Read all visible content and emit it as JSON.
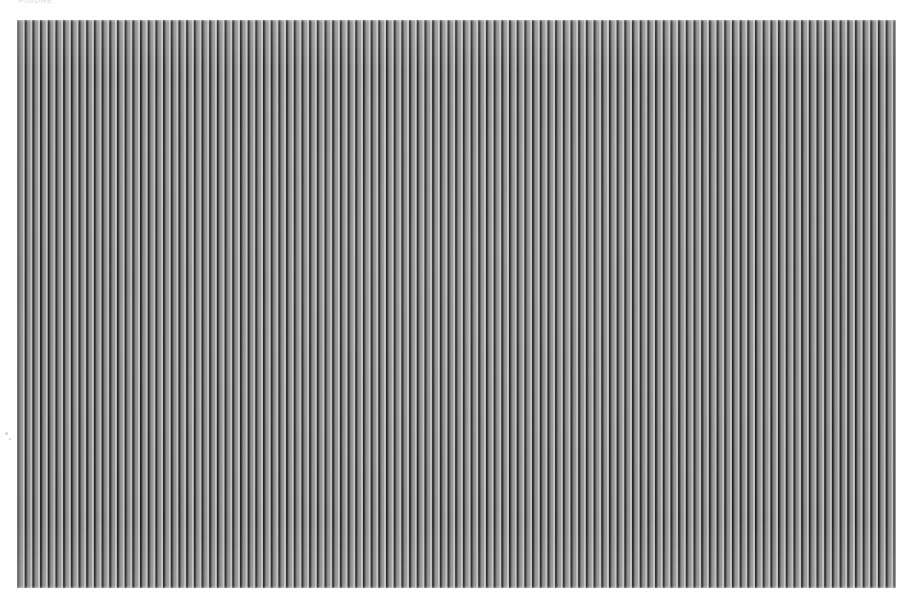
{
  "page": {
    "width_px": 912,
    "height_px": 610,
    "background_color": "#ffffff"
  },
  "caption": {
    "text": "FIGURE",
    "note": "faint caption text cropped at top edge, largely illegible",
    "color": "#d8d8d8"
  },
  "grating": {
    "label": "vertical-stripe-grating",
    "left_px": 17,
    "top_px": 20,
    "width_px": 879,
    "height_px": 568,
    "stripe_period_px": 7.7,
    "stripe_count": 114,
    "orientation": "vertical",
    "dark_line_color": "#1d1d1d",
    "mid_tone_color": "#8f8f8f",
    "light_tone_color": "#dcdcdc",
    "margin_color": "#ffffff"
  },
  "specks": [
    {
      "left_px": 5,
      "top_px": 432,
      "size_px": 3
    },
    {
      "left_px": 9,
      "top_px": 438,
      "size_px": 2
    }
  ]
}
